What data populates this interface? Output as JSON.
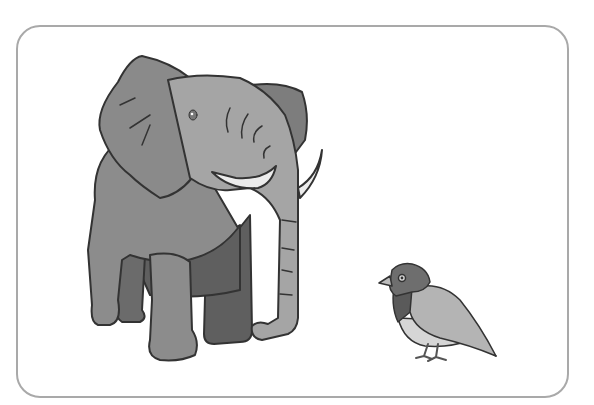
{
  "scene": {
    "description": "Illustration of a large elephant and a small bird inside a rounded frame",
    "subjects": [
      "elephant",
      "bird"
    ],
    "colors": {
      "frame_border": "#a9a9a9",
      "background": "#ffffff",
      "elephant_body": "#8c8c8c",
      "elephant_head": "#a5a5a5",
      "elephant_dark": "#5f5f5f",
      "tusk": "#ececec",
      "outline": "#333333",
      "bird_head": "#6e6e6e",
      "bird_neck": "#5a5a5a",
      "bird_wing": "#b4b4b4",
      "bird_belly": "#d6d6d6"
    }
  }
}
